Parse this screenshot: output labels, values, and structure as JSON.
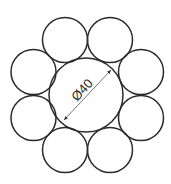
{
  "diagram": {
    "type": "wire-rope-cross-section",
    "core": {
      "cx": 86,
      "cy": 95,
      "r": 37
    },
    "strands": [
      {
        "cx": 65,
        "cy": 40,
        "r": 22.5
      },
      {
        "cx": 110,
        "cy": 40,
        "r": 22.5
      },
      {
        "cx": 141,
        "cy": 72,
        "r": 22.5
      },
      {
        "cx": 141,
        "cy": 118,
        "r": 22.5
      },
      {
        "cx": 110,
        "cy": 150,
        "r": 22.5
      },
      {
        "cx": 65,
        "cy": 150,
        "r": 22.5
      },
      {
        "cx": 33.5,
        "cy": 118,
        "r": 22.5
      },
      {
        "cx": 33.5,
        "cy": 72,
        "r": 22.5
      }
    ],
    "dimension": {
      "label": "Ø40",
      "x1": 64,
      "y1": 120,
      "x2": 111,
      "y2": 70
    },
    "stroke_color": "#2a2a2a"
  }
}
